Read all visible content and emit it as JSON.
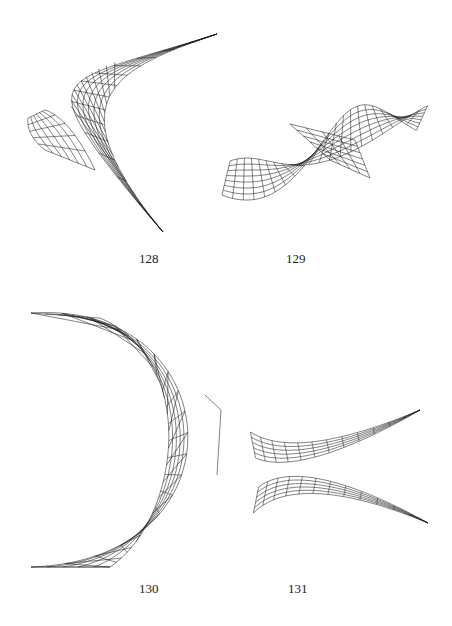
{
  "page": {
    "background": "#ffffff",
    "line_color": "#1a1a1a"
  },
  "figures": [
    {
      "id": "fig-128",
      "label": "128",
      "label_pos": [
        139,
        252
      ],
      "description": "twisted saddle surface wireframe with sharp cusp, long tip to upper right and lower right"
    },
    {
      "id": "fig-129",
      "label": "129",
      "label_pos": [
        286,
        252
      ],
      "description": "helicoidal twisted ribbon wireframe, horizontal"
    },
    {
      "id": "fig-130",
      "label": "130",
      "label_pos": [
        139,
        582
      ],
      "description": "crescent-shaped ruled surface wireframe opening to the left"
    },
    {
      "id": "fig-131",
      "label": "131",
      "label_pos": [
        288,
        582
      ],
      "description": "crossed thin ribbon wireframe forming an X"
    }
  ]
}
